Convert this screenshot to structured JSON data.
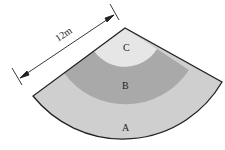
{
  "diagram": {
    "type": "sector",
    "dimension_label": "12m",
    "regions": [
      {
        "id": "A",
        "label": "A",
        "color": "#cfcfcf"
      },
      {
        "id": "B",
        "label": "B",
        "color": "#a9a9a9"
      },
      {
        "id": "C",
        "label": "C",
        "color": "#e4e4e4"
      }
    ],
    "outline_color": "#222222"
  }
}
